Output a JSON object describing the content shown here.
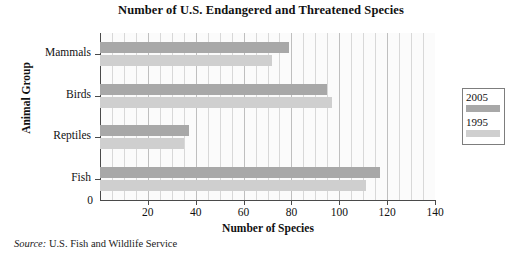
{
  "chart_data": {
    "type": "bar",
    "orientation": "horizontal",
    "title": "Number of U.S. Endangered and Threatened Species",
    "xlabel": "Number of Species",
    "ylabel": "Animal Group",
    "categories": [
      "Mammals",
      "Birds",
      "Reptiles",
      "Fish"
    ],
    "series": [
      {
        "name": "2005",
        "values": [
          79,
          95,
          37,
          117
        ],
        "color": "#a8a8a8"
      },
      {
        "name": "1995",
        "values": [
          72,
          97,
          35,
          111
        ],
        "color": "#cfcfcf"
      }
    ],
    "xlim": [
      0,
      140
    ],
    "xticks": [
      0,
      20,
      40,
      60,
      80,
      100,
      120,
      140
    ],
    "xtick_labels": [
      "0",
      "20",
      "40",
      "60",
      "80",
      "100",
      "120",
      "140"
    ],
    "minor_gridlines": true,
    "minor_tick_step": 5,
    "grid": true,
    "legend_position": "right-outside",
    "legend_entries": [
      "2005",
      "1995"
    ]
  },
  "source": {
    "prefix": "Source:",
    "text": "U.S. Fish and Wildlife Service"
  }
}
